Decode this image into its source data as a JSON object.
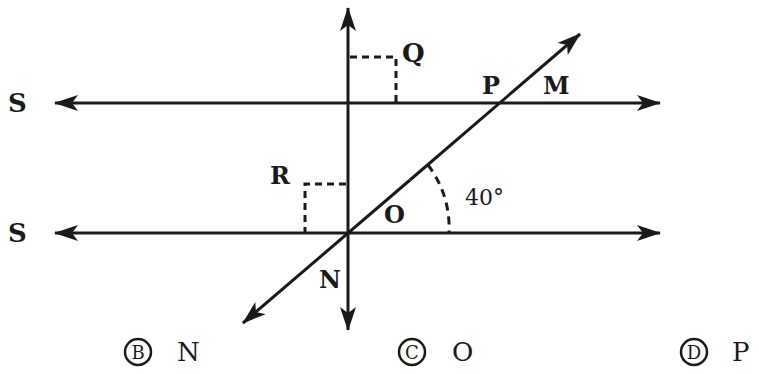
{
  "diagram": {
    "labels": {
      "s_top": "S",
      "s_bottom": "S",
      "q": "Q",
      "p": "P",
      "m": "M",
      "r": "R",
      "o": "O",
      "n": "N",
      "angle": "40°"
    },
    "colors": {
      "stroke": "#1a1a1a",
      "background": "#ffffff"
    }
  },
  "options": [
    {
      "letter": "B",
      "value": "N"
    },
    {
      "letter": "C",
      "value": "O"
    },
    {
      "letter": "D",
      "value": "P"
    }
  ]
}
